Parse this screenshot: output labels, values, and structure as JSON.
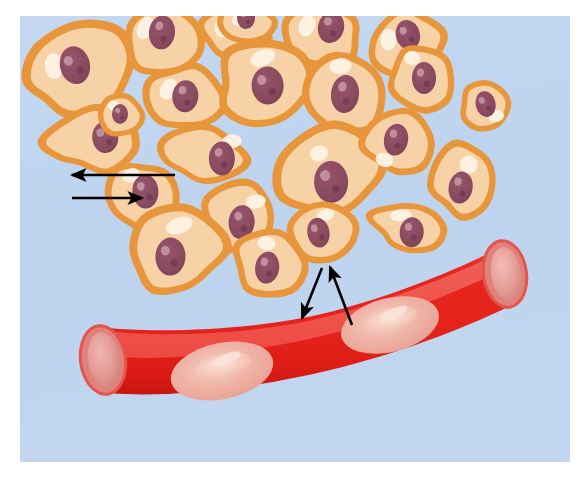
{
  "figure": {
    "title": "Tissue cells and blood capillary exchange illustration",
    "canvas": {
      "width": 586,
      "height": 478
    },
    "frame": {
      "page_background": "#ffffff",
      "panel_background": "#bcd2ee",
      "panel_background_alt": "#c3d7f0",
      "panel_x": 20,
      "panel_y": 16,
      "panel_width": 550,
      "panel_height": 446
    },
    "palette": {
      "cell_fill": "#f7d2a6",
      "cell_fill_light": "#fadfbe",
      "cell_outline": "#e8963c",
      "cell_highlight": "#fdf3e4",
      "nucleus_fill": "#8a4a60",
      "nucleus_dark": "#6f3a50",
      "nucleus_spot": "#c79aa6",
      "vessel_red": "#e8231d",
      "vessel_red_dark": "#d51a14",
      "vessel_red_light": "#f04a40",
      "vessel_lumen_light": "#f2665c",
      "vessel_rim": "#e0847f",
      "vessel_opening": "#e79a95",
      "vessel_opening_inner": "#d9827c",
      "rbc_fill": "#eeaa9e",
      "rbc_center": "#f6cfc4",
      "rbc_highlight": "#fbe3d9",
      "arrow_color": "#000000"
    }
  },
  "labels": {
    "tissue_cells_group": "Tissue cells",
    "capillary": "Blood capillary",
    "red_blood_cells": "Red blood cells",
    "tissue_exchange_arrows": "Exchange between tissue cells",
    "vessel_exchange_arrows": "Exchange between blood and tissue"
  },
  "arrows": {
    "tissue": [
      {
        "name": "tissue-arrow-left",
        "direction": "left",
        "from_x": 175,
        "from_y": 175,
        "to_x": 72,
        "to_y": 175,
        "description": "Arrow pointing left away from tissue cell"
      },
      {
        "name": "tissue-arrow-right",
        "direction": "right",
        "from_x": 72,
        "from_y": 198,
        "to_x": 142,
        "to_y": 198,
        "description": "Arrow pointing right toward tissue cell"
      }
    ],
    "vessel": [
      {
        "name": "vessel-arrow-down",
        "direction": "down-left",
        "from_x": 322,
        "from_y": 268,
        "to_x": 302,
        "to_y": 318,
        "description": "Arrow pointing down into the capillary"
      },
      {
        "name": "vessel-arrow-up",
        "direction": "up-left",
        "from_x": 352,
        "from_y": 325,
        "to_x": 330,
        "to_y": 267,
        "description": "Arrow pointing up out of the capillary"
      }
    ]
  },
  "cells": [
    {
      "id": 1,
      "cx": 82,
      "cy": 72,
      "rx": 54,
      "ry": 38,
      "rot": -22,
      "nx": 78,
      "ny": 63,
      "nrx": 15,
      "nry": 19,
      "nrot": 10,
      "hx": 58,
      "hy": 56,
      "hrx": 9,
      "hry": 13,
      "hrot": 20,
      "shape": "teardrop"
    },
    {
      "id": 2,
      "cx": 164,
      "cy": 42,
      "rx": 40,
      "ry": 34,
      "rot": 12,
      "nx": 160,
      "ny": 33,
      "nrx": 13,
      "nry": 17,
      "nrot": -5,
      "hx": 143,
      "hy": 32,
      "hrx": 8,
      "hry": 12,
      "hrot": 15,
      "shape": "round"
    },
    {
      "id": 3,
      "cx": 237,
      "cy": 30,
      "rx": 34,
      "ry": 26,
      "rot": -6,
      "nx": 236,
      "ny": 22,
      "nrx": 11,
      "nry": 14,
      "nrot": 0,
      "hx": 222,
      "hy": 26,
      "hrx": 7,
      "hry": 10,
      "hrot": 10,
      "shape": "round"
    },
    {
      "id": 4,
      "cx": 322,
      "cy": 34,
      "rx": 40,
      "ry": 30,
      "rot": 8,
      "nx": 330,
      "ny": 26,
      "nrx": 13,
      "nry": 16,
      "nrot": 5,
      "hx": 306,
      "hy": 28,
      "hrx": 8,
      "hry": 11,
      "hrot": 15,
      "shape": "round"
    },
    {
      "id": 5,
      "cx": 404,
      "cy": 44,
      "rx": 38,
      "ry": 30,
      "rot": -14,
      "nx": 410,
      "ny": 36,
      "nrx": 12,
      "nry": 15,
      "nrot": 0,
      "hx": 390,
      "hy": 36,
      "hrx": 8,
      "hry": 11,
      "hrot": 20,
      "shape": "round"
    },
    {
      "id": 6,
      "cx": 184,
      "cy": 98,
      "rx": 40,
      "ry": 32,
      "rot": 10,
      "nx": 185,
      "ny": 96,
      "nrx": 13,
      "nry": 16,
      "nrot": -5,
      "hx": 167,
      "hy": 92,
      "hrx": 8,
      "hry": 11,
      "hrot": 18,
      "shape": "round"
    },
    {
      "id": 7,
      "cx": 265,
      "cy": 88,
      "rx": 48,
      "ry": 38,
      "rot": -10,
      "nx": 268,
      "ny": 86,
      "nrx": 16,
      "nry": 19,
      "nrot": 8,
      "hx": 268,
      "hy": 58,
      "hrx": 13,
      "hry": 8,
      "hrot": -12,
      "shape": "teardrop"
    },
    {
      "id": 8,
      "cx": 345,
      "cy": 94,
      "rx": 40,
      "ry": 38,
      "rot": 14,
      "nx": 345,
      "ny": 94,
      "nrx": 14,
      "nry": 19,
      "nrot": -8,
      "hx": 334,
      "hy": 68,
      "hrx": 11,
      "hry": 8,
      "hrot": -20,
      "shape": "round"
    },
    {
      "id": 9,
      "cx": 422,
      "cy": 78,
      "rx": 32,
      "ry": 32,
      "rot": 0,
      "nx": 424,
      "ny": 78,
      "nrx": 12,
      "nry": 16,
      "nrot": 0,
      "hx": 412,
      "hy": 58,
      "hrx": 8,
      "hry": 7,
      "hrot": 0,
      "shape": "round"
    },
    {
      "id": 10,
      "cx": 92,
      "cy": 142,
      "rx": 52,
      "ry": 30,
      "rot": -12,
      "nx": 106,
      "ny": 140,
      "nrx": 13,
      "nry": 16,
      "nrot": 10,
      "hx": 115,
      "hy": 126,
      "hrx": 11,
      "hry": 7,
      "hrot": -18,
      "shape": "wedge"
    },
    {
      "id": 11,
      "cx": 198,
      "cy": 156,
      "rx": 46,
      "ry": 28,
      "rot": 6,
      "nx": 222,
      "ny": 156,
      "nrx": 13,
      "nry": 17,
      "nrot": -5,
      "hx": 230,
      "hy": 138,
      "hrx": 10,
      "hry": 7,
      "hrot": -15,
      "shape": "wedge"
    },
    {
      "id": 12,
      "cx": 330,
      "cy": 174,
      "rx": 52,
      "ry": 42,
      "rot": -8,
      "nx": 330,
      "ny": 182,
      "nrx": 17,
      "nry": 21,
      "nrot": 6,
      "hx": 322,
      "hy": 152,
      "hrx": 9,
      "hry": 8,
      "hrot": -10,
      "shape": "teardrop"
    },
    {
      "id": 13,
      "cx": 398,
      "cy": 140,
      "rx": 34,
      "ry": 32,
      "rot": 10,
      "nx": 396,
      "ny": 140,
      "nrx": 12,
      "nry": 16,
      "nrot": 0,
      "hx": 388,
      "hy": 162,
      "hrx": 9,
      "hry": 7,
      "hrot": 10,
      "shape": "round"
    },
    {
      "id": 14,
      "cx": 464,
      "cy": 180,
      "rx": 30,
      "ry": 36,
      "rot": 10,
      "nx": 462,
      "ny": 188,
      "nrx": 12,
      "nry": 16,
      "nrot": 0,
      "hx": 466,
      "hy": 164,
      "hrx": 9,
      "hry": 9,
      "hrot": 0,
      "shape": "round"
    },
    {
      "id": 15,
      "cx": 142,
      "cy": 196,
      "rx": 38,
      "ry": 34,
      "rot": -8,
      "nx": 146,
      "ny": 192,
      "nrx": 13,
      "nry": 17,
      "nrot": 5,
      "hx": 134,
      "hy": 174,
      "hrx": 9,
      "hry": 7,
      "hrot": -15,
      "shape": "round"
    },
    {
      "id": 16,
      "cx": 240,
      "cy": 218,
      "rx": 36,
      "ry": 34,
      "rot": 6,
      "nx": 242,
      "ny": 222,
      "nrx": 13,
      "nry": 17,
      "nrot": 0,
      "hx": 254,
      "hy": 200,
      "hrx": 10,
      "hry": 7,
      "hrot": -15,
      "shape": "round"
    },
    {
      "id": 17,
      "cx": 176,
      "cy": 252,
      "rx": 48,
      "ry": 38,
      "rot": -6,
      "nx": 170,
      "ny": 256,
      "nrx": 15,
      "nry": 19,
      "nrot": 8,
      "hx": 182,
      "hy": 226,
      "hrx": 14,
      "hry": 8,
      "hrot": -14,
      "shape": "teardrop"
    },
    {
      "id": 18,
      "cx": 270,
      "cy": 262,
      "rx": 34,
      "ry": 32,
      "rot": 8,
      "nx": 268,
      "ny": 268,
      "nrx": 12,
      "nry": 16,
      "nrot": 0,
      "hx": 264,
      "hy": 244,
      "hrx": 9,
      "hry": 7,
      "hrot": 0,
      "shape": "round"
    },
    {
      "id": 19,
      "cx": 322,
      "cy": 230,
      "rx": 34,
      "ry": 28,
      "rot": -10,
      "nx": 318,
      "ny": 232,
      "nrx": 11,
      "nry": 15,
      "nrot": 0,
      "hx": 328,
      "hy": 216,
      "hrx": 9,
      "hry": 6,
      "hrot": -10,
      "shape": "round"
    },
    {
      "id": 20,
      "cx": 408,
      "cy": 228,
      "rx": 38,
      "ry": 26,
      "rot": 4,
      "nx": 412,
      "ny": 232,
      "nrx": 12,
      "nry": 15,
      "nrot": 0,
      "hx": 400,
      "hy": 216,
      "hrx": 11,
      "hry": 6,
      "hrot": -8,
      "shape": "wedge"
    },
    {
      "id": 21,
      "cx": 122,
      "cy": 116,
      "rx": 22,
      "ry": 18,
      "rot": 0,
      "nx": 120,
      "ny": 114,
      "nrx": 8,
      "nry": 10,
      "nrot": 0,
      "hx": 114,
      "hy": 106,
      "hrx": 6,
      "hry": 5,
      "hrot": 0,
      "shape": "round"
    },
    {
      "id": 22,
      "cx": 486,
      "cy": 106,
      "rx": 26,
      "ry": 22,
      "rot": -12,
      "nx": 486,
      "ny": 104,
      "nrx": 10,
      "nry": 13,
      "nrot": 0,
      "hx": 494,
      "hy": 118,
      "hrx": 8,
      "hry": 6,
      "hrot": 0,
      "shape": "round"
    },
    {
      "id": 23,
      "cx": 246,
      "cy": 22,
      "rx": 26,
      "ry": 18,
      "rot": 0,
      "nx": 246,
      "ny": 18,
      "nrx": 9,
      "nry": 11,
      "nrot": 0,
      "hx": 238,
      "hy": 20,
      "hrx": 6,
      "hry": 6,
      "hrot": 0,
      "shape": "round"
    }
  ],
  "vessel": {
    "name": "blood-capillary",
    "left_opening": {
      "cx": 103,
      "cy": 360,
      "rx": 20,
      "ry": 32,
      "rot": -8
    },
    "right_opening": {
      "cx": 504,
      "cy": 275,
      "rx": 19,
      "ry": 31,
      "rot": -8
    },
    "red_blood_cells": [
      {
        "id": 1,
        "cx": 222,
        "cy": 371,
        "rx": 52,
        "ry": 28,
        "rot": -12
      },
      {
        "id": 2,
        "cx": 390,
        "cy": 325,
        "rx": 50,
        "ry": 27,
        "rot": -14
      }
    ]
  }
}
